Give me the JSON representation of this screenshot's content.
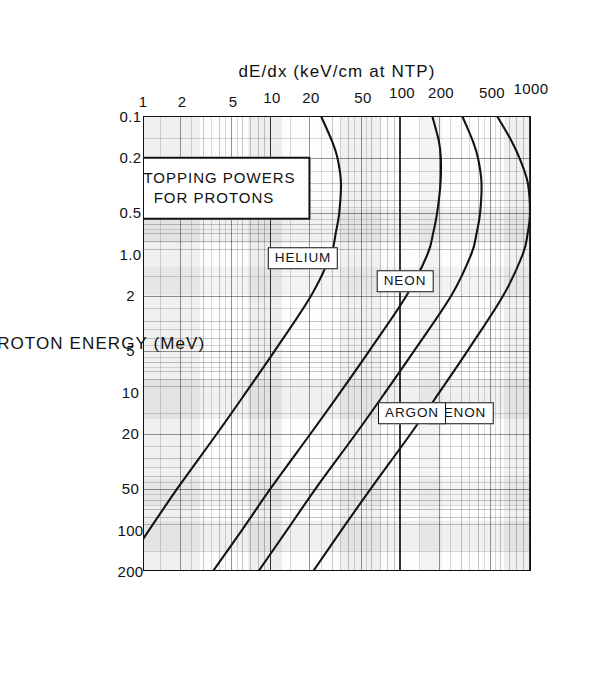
{
  "figure": {
    "legend_title_line1": "STOPPING POWERS",
    "legend_title_line2": "FOR PROTONS"
  },
  "axes": {
    "x_title": "PROTON ENERGY (MeV)",
    "y_title": "dE/dx (keV/cm at NTP)"
  },
  "chart_data": {
    "type": "line",
    "title": "STOPPING POWERS FOR PROTONS",
    "xlabel": "PROTON ENERGY (MeV)",
    "ylabel": "dE/dx (keV/cm at NTP)",
    "xscale": "log",
    "yscale": "log",
    "xlim": [
      0.1,
      200
    ],
    "ylim": [
      1,
      1000
    ],
    "grid": true,
    "legend_position": "inline-labels",
    "xticks": [
      "0.1",
      "0.2",
      "0.5",
      "1.0",
      "2",
      "5",
      "10",
      "20",
      "50",
      "100",
      "200"
    ],
    "xtick_values": [
      0.1,
      0.2,
      0.5,
      1.0,
      2,
      5,
      10,
      20,
      50,
      100,
      200
    ],
    "yticks": [
      "1",
      "2",
      "5",
      "10",
      "20",
      "50",
      "100",
      "200",
      "500",
      "1000"
    ],
    "ytick_values": [
      1,
      2,
      5,
      10,
      20,
      50,
      100,
      200,
      500,
      1000
    ],
    "series": [
      {
        "name": "XENON",
        "x": [
          0.1,
          0.15,
          0.2,
          0.3,
          0.5,
          0.7,
          1.0,
          2.0,
          5.0,
          10.0,
          20.0,
          50.0,
          100.0,
          200.0
        ],
        "y": [
          560,
          720,
          830,
          960,
          1000,
          960,
          880,
          620,
          330,
          200,
          120,
          59,
          35,
          21
        ]
      },
      {
        "name": "ARGON",
        "x": [
          0.1,
          0.15,
          0.2,
          0.3,
          0.5,
          0.7,
          1.0,
          2.0,
          5.0,
          10.0,
          20.0,
          50.0,
          100.0,
          200.0
        ],
        "y": [
          300,
          360,
          395,
          420,
          410,
          385,
          350,
          245,
          127,
          76,
          45,
          22,
          13.2,
          7.9
        ]
      },
      {
        "name": "NEON",
        "x": [
          0.1,
          0.15,
          0.2,
          0.3,
          0.5,
          0.7,
          1.0,
          2.0,
          5.0,
          10.0,
          20.0,
          50.0,
          100.0,
          200.0
        ],
        "y": [
          175,
          196,
          203,
          202,
          190,
          177,
          160,
          110,
          57,
          34,
          20,
          9.8,
          5.9,
          3.5
        ]
      },
      {
        "name": "HELIUM",
        "x": [
          0.1,
          0.15,
          0.2,
          0.3,
          0.5,
          0.7,
          1.0,
          2.0,
          5.0,
          10.0,
          20.0,
          50.0,
          100.0,
          200.0
        ],
        "y": [
          24,
          29,
          32,
          34,
          33,
          31,
          28.5,
          20,
          10.5,
          6.3,
          3.75,
          1.85,
          1.12,
          0.68
        ]
      }
    ],
    "annotations": [
      {
        "text": "XENON",
        "x": 14.0,
        "y": 290
      },
      {
        "text": "ARGON",
        "x": 14.0,
        "y": 123
      },
      {
        "text": "NEON",
        "x": 1.55,
        "y": 108
      },
      {
        "text": "HELIUM",
        "x": 1.05,
        "y": 17.5
      }
    ]
  }
}
